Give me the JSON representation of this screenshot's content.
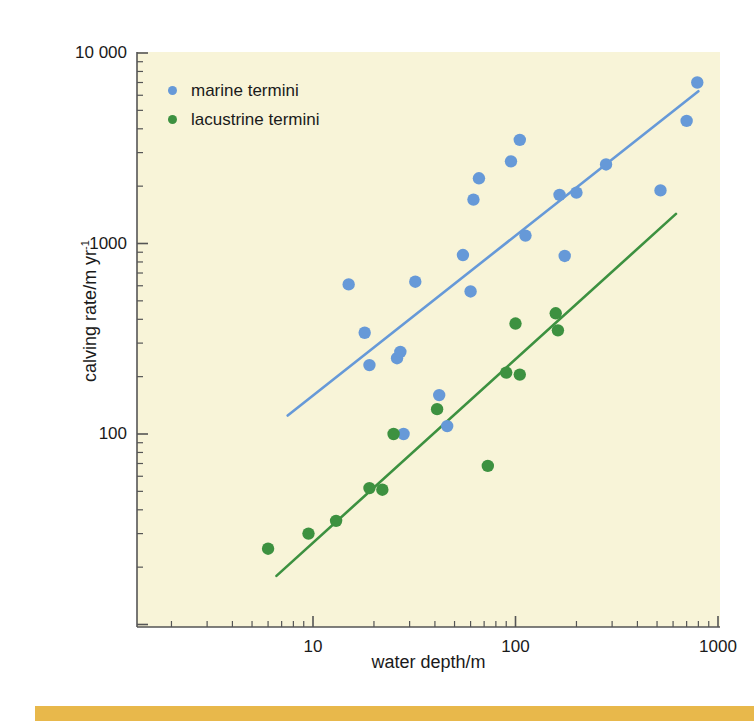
{
  "figure": {
    "background_color": "#ffffff",
    "plot_background_color": "#f8f4d8",
    "bottom_band_color": "#e8b84b"
  },
  "legend": {
    "position": "top-left",
    "items": [
      {
        "label": "marine termini",
        "color": "#6699d8"
      },
      {
        "label": "lacustrine termini",
        "color": "#3d9140"
      }
    ]
  },
  "axes": {
    "x": {
      "title": "water depth/m",
      "scale": "log",
      "tick_labels": [
        "10",
        "100",
        "1000"
      ],
      "tick_values": [
        10,
        100,
        1000
      ],
      "range": [
        2,
        1100
      ]
    },
    "y": {
      "title": "calving rate/m yr",
      "title_exponent": "-1",
      "scale": "log",
      "tick_labels": [
        "10 000",
        "1000",
        "100"
      ],
      "tick_values": [
        10000,
        1000,
        100
      ],
      "range": [
        13,
        10000
      ]
    }
  },
  "chart_data": {
    "type": "scatter",
    "title": "",
    "xlabel": "water depth/m",
    "ylabel": "calving rate/m yr^-1",
    "xscale": "log",
    "yscale": "log",
    "xlim": [
      2,
      1100
    ],
    "ylim": [
      13,
      10000
    ],
    "grid": false,
    "legend_position": "upper left",
    "series": [
      {
        "name": "marine termini",
        "color": "#6699d8",
        "marker": "circle",
        "points": [
          {
            "x": 15,
            "y": 610
          },
          {
            "x": 18,
            "y": 340
          },
          {
            "x": 19,
            "y": 230
          },
          {
            "x": 26,
            "y": 250
          },
          {
            "x": 27,
            "y": 270
          },
          {
            "x": 28,
            "y": 100
          },
          {
            "x": 32,
            "y": 630
          },
          {
            "x": 42,
            "y": 160
          },
          {
            "x": 46,
            "y": 110
          },
          {
            "x": 55,
            "y": 870
          },
          {
            "x": 60,
            "y": 560
          },
          {
            "x": 62,
            "y": 1700
          },
          {
            "x": 66,
            "y": 2200
          },
          {
            "x": 95,
            "y": 2700
          },
          {
            "x": 105,
            "y": 3500
          },
          {
            "x": 112,
            "y": 1100
          },
          {
            "x": 165,
            "y": 1800
          },
          {
            "x": 175,
            "y": 860
          },
          {
            "x": 200,
            "y": 1850
          },
          {
            "x": 280,
            "y": 2600
          },
          {
            "x": 520,
            "y": 1900
          },
          {
            "x": 700,
            "y": 4400
          },
          {
            "x": 790,
            "y": 7000
          }
        ],
        "fit_line": {
          "x_start": 7.5,
          "y_start": 125,
          "x_end": 800,
          "y_end": 6300
        }
      },
      {
        "name": "lacustrine termini",
        "color": "#3d9140",
        "marker": "circle",
        "points": [
          {
            "x": 6,
            "y": 25
          },
          {
            "x": 9.5,
            "y": 30
          },
          {
            "x": 13,
            "y": 35
          },
          {
            "x": 19,
            "y": 52
          },
          {
            "x": 22,
            "y": 51
          },
          {
            "x": 25,
            "y": 100
          },
          {
            "x": 41,
            "y": 135
          },
          {
            "x": 73,
            "y": 68
          },
          {
            "x": 90,
            "y": 210
          },
          {
            "x": 100,
            "y": 380
          },
          {
            "x": 105,
            "y": 205
          },
          {
            "x": 158,
            "y": 430
          },
          {
            "x": 162,
            "y": 350
          }
        ],
        "fit_line": {
          "x_start": 6.6,
          "y_start": 18,
          "x_end": 620,
          "y_end": 1430
        }
      }
    ]
  }
}
